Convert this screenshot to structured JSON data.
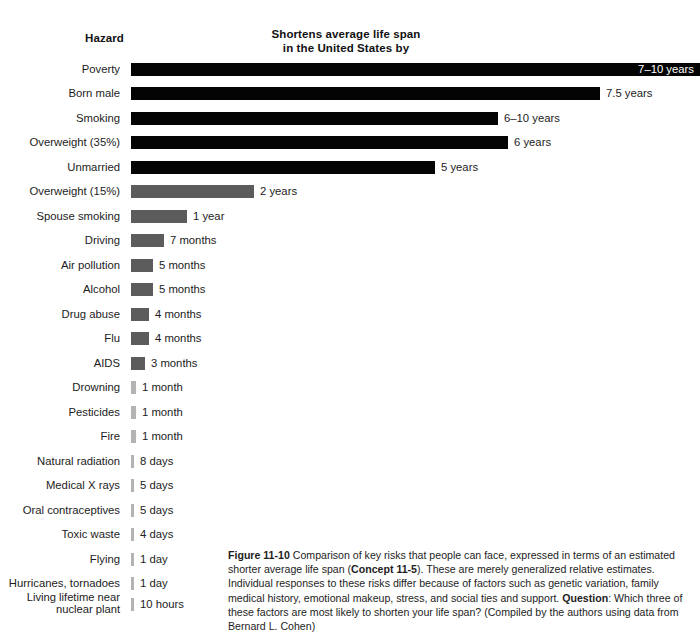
{
  "header": {
    "hazard_label": "Hazard",
    "metric_line1": "Shortens average life span",
    "metric_line2": "in the United States by"
  },
  "caption": {
    "figure_number": "Figure 11-10",
    "concept_ref": "Concept 11-5",
    "question_label": "Question",
    "text_part1": "  Comparison of key risks that people can face, expressed in terms of an estimated shorter average life span (",
    "text_part2": "). These are merely generalized relative estimates. Individual responses to these risks differ because of factors such as genetic variation, family medical history, emotional makeup, stress, and social ties and support. ",
    "text_part3": ": Which three of these factors are most likely to shorten your life span?  (Compiled by the authors using data from Bernard L. Cohen)"
  },
  "colors": {
    "bar_black": "#040404",
    "bar_mid_gray": "#5c5c5c",
    "bar_light_gray": "#b3b3b3",
    "text": "#1c1c1c",
    "background": "#ffffff"
  },
  "chart_data": {
    "type": "bar",
    "title": "Shortens average life span in the United States by",
    "xlabel": "",
    "ylabel": "Hazard",
    "orientation": "horizontal",
    "grid": false,
    "legend": "none",
    "categories": [
      "Poverty",
      "Born male",
      "Smoking",
      "Overweight (35%)",
      "Unmarried",
      "Overweight (15%)",
      "Spouse smoking",
      "Driving",
      "Air pollution",
      "Alcohol",
      "Drug abuse",
      "Flu",
      "AIDS",
      "Drowning",
      "Pesticides",
      "Fire",
      "Natural radiation",
      "Medical X rays",
      "Oral contraceptives",
      "Toxic waste",
      "Flying",
      "Hurricanes, tornadoes",
      "Living lifetime near nuclear plant"
    ],
    "value_labels": [
      "7–10 years",
      "7.5 years",
      "6–10 years",
      "6 years",
      "5 years",
      "2 years",
      "1 year",
      "7 months",
      "5 months",
      "5 months",
      "4 months",
      "4 months",
      "3 months",
      "1 month",
      "1 month",
      "1 month",
      "8 days",
      "5 days",
      "5 days",
      "4 days",
      "1 day",
      "1 day",
      "10 hours"
    ],
    "values_years": [
      8.5,
      7.5,
      8.0,
      6.0,
      5.0,
      2.0,
      1.0,
      0.583,
      0.417,
      0.417,
      0.333,
      0.333,
      0.25,
      0.083,
      0.083,
      0.083,
      0.0219,
      0.0137,
      0.0137,
      0.011,
      0.0027,
      0.0027,
      0.0011
    ],
    "ylim": [
      0,
      10
    ]
  },
  "rows": [
    {
      "category": "Poverty",
      "label": "7–10 years",
      "bar_w": 569,
      "tone": "black",
      "label_inside": true,
      "y": 63
    },
    {
      "category": "Born male",
      "label": "7.5 years",
      "bar_w": 469,
      "tone": "black",
      "label_inside": false,
      "y": 87
    },
    {
      "category": "Smoking",
      "label": "6–10 years",
      "bar_w": 367,
      "tone": "black",
      "label_inside": false,
      "y": 112
    },
    {
      "category": "Overweight (35%)",
      "label": "6 years",
      "bar_w": 377,
      "tone": "black",
      "label_inside": false,
      "y": 136
    },
    {
      "category": "Unmarried",
      "label": "5 years",
      "bar_w": 304,
      "tone": "black",
      "label_inside": false,
      "y": 161
    },
    {
      "category": "Overweight (15%)",
      "label": "2 years",
      "bar_w": 123,
      "tone": "mid",
      "label_inside": false,
      "y": 185
    },
    {
      "category": "Spouse smoking",
      "label": "1 year",
      "bar_w": 56,
      "tone": "mid",
      "label_inside": false,
      "y": 210
    },
    {
      "category": "Driving",
      "label": "7 months",
      "bar_w": 33,
      "tone": "mid",
      "label_inside": false,
      "y": 234
    },
    {
      "category": "Air pollution",
      "label": "5 months",
      "bar_w": 22,
      "tone": "mid",
      "label_inside": false,
      "y": 259
    },
    {
      "category": "Alcohol",
      "label": "5 months",
      "bar_w": 22,
      "tone": "mid",
      "label_inside": false,
      "y": 283
    },
    {
      "category": "Drug abuse",
      "label": "4 months",
      "bar_w": 18,
      "tone": "mid",
      "label_inside": false,
      "y": 308
    },
    {
      "category": "Flu",
      "label": "4 months",
      "bar_w": 18,
      "tone": "mid",
      "label_inside": false,
      "y": 332
    },
    {
      "category": "AIDS",
      "label": "3 months",
      "bar_w": 14,
      "tone": "mid",
      "label_inside": false,
      "y": 357
    },
    {
      "category": "Drowning",
      "label": "1 month",
      "bar_w": 5,
      "tone": "thin",
      "label_inside": false,
      "y": 381
    },
    {
      "category": "Pesticides",
      "label": "1 month",
      "bar_w": 5,
      "tone": "thin",
      "label_inside": false,
      "y": 406
    },
    {
      "category": "Fire",
      "label": "1 month",
      "bar_w": 5,
      "tone": "thin",
      "label_inside": false,
      "y": 430
    },
    {
      "category": "Natural radiation",
      "label": "8 days",
      "bar_w": 3,
      "tone": "thin",
      "label_inside": false,
      "y": 455
    },
    {
      "category": "Medical X rays",
      "label": "5 days",
      "bar_w": 3,
      "tone": "thin",
      "label_inside": false,
      "y": 479
    },
    {
      "category": "Oral contraceptives",
      "label": "5 days",
      "bar_w": 3,
      "tone": "thin",
      "label_inside": false,
      "y": 504
    },
    {
      "category": "Toxic waste",
      "label": "4 days",
      "bar_w": 3,
      "tone": "thin",
      "label_inside": false,
      "y": 528
    },
    {
      "category": "Flying",
      "label": "1 day",
      "bar_w": 3,
      "tone": "thin",
      "label_inside": false,
      "y": 553
    },
    {
      "category": "Hurricanes, tornadoes",
      "label": "1 day",
      "bar_w": 3,
      "tone": "thin",
      "label_inside": false,
      "y": 577
    },
    {
      "category": "Living lifetime near nuclear plant",
      "label": "10 hours",
      "bar_w": 3,
      "tone": "thin",
      "label_inside": false,
      "y": 598,
      "two_line": true
    }
  ]
}
